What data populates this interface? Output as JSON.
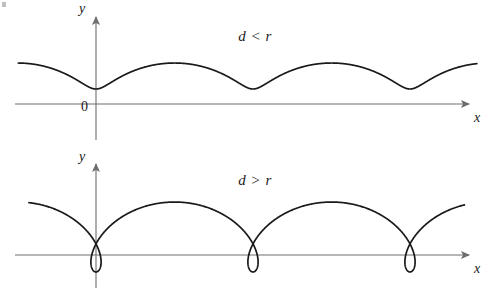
{
  "figure": {
    "width": 494,
    "height": 291,
    "background": "#ffffff",
    "curve_color": "#1a1a1a",
    "axis_color": "#6e6e6e"
  },
  "panels": [
    {
      "id": "curtate-cycloid",
      "condition_label": "d < r",
      "condition_x": 255,
      "condition_y": 40,
      "y_axis_label": "y",
      "x_axis_label": "x",
      "origin_label": "0",
      "origin_x": 96,
      "axis_y": 104,
      "x_axis_start": 15,
      "x_axis_end": 478,
      "y_axis_top": 8,
      "y_axis_bottom": 140,
      "curve": {
        "type": "curtate-cycloid",
        "r": 25,
        "d": 13,
        "period": 157,
        "baseline": 101,
        "t_start": -3.12,
        "t_end": 15.4,
        "x_at_t0": 96
      }
    },
    {
      "id": "prolate-cycloid",
      "condition_label": "d > r",
      "condition_x": 255,
      "condition_y": 184,
      "y_axis_label": "y",
      "x_axis_label": "x",
      "origin_label": "",
      "origin_x": 96,
      "axis_y": 255,
      "x_axis_start": 15,
      "x_axis_end": 478,
      "y_axis_top": 155,
      "y_axis_bottom": 288,
      "curve": {
        "type": "prolate-cycloid",
        "r": 25,
        "d": 35,
        "period": 157,
        "baseline": 262,
        "t_start": -2.95,
        "t_end": 15.3,
        "x_at_t0": 96
      }
    }
  ],
  "chart_data": {
    "type": "line",
    "title": "",
    "xlabel": "x",
    "ylabel": "y",
    "grid": false,
    "legend": null,
    "annotations": [
      {
        "text": "d < r",
        "panel": 0,
        "meaning": "curtate cycloid: tracing point inside the rolling circle"
      },
      {
        "text": "d > r",
        "panel": 1,
        "meaning": "prolate cycloid: tracing point outside the rolling circle"
      },
      {
        "text": "0",
        "panel": 0,
        "meaning": "origin marker on the x-axis"
      }
    ],
    "series": [
      {
        "name": "d < r (curtate cycloid)",
        "panel": 0,
        "parametric": "x = r*t - d*sin(t), y = r - d*cos(t)",
        "r": 25,
        "d": 13,
        "period_px": 157,
        "minima_x_px": [
          96,
          253,
          410
        ],
        "minima_y_px": [
          88,
          88,
          88
        ],
        "maxima_x_px": [
          175,
          332,
          489
        ],
        "maxima_y_px": [
          62,
          62,
          62
        ]
      },
      {
        "name": "d > r (prolate cycloid)",
        "panel": 1,
        "parametric": "x = r*t - d*sin(t), y = r - d*cos(t)",
        "r": 25,
        "d": 35,
        "period_px": 157,
        "loop_center_x_px": [
          96,
          253,
          410
        ],
        "node_y_px": 227,
        "loop_bottom_y_px": 277,
        "arch_peak_y_px": 190
      }
    ]
  }
}
